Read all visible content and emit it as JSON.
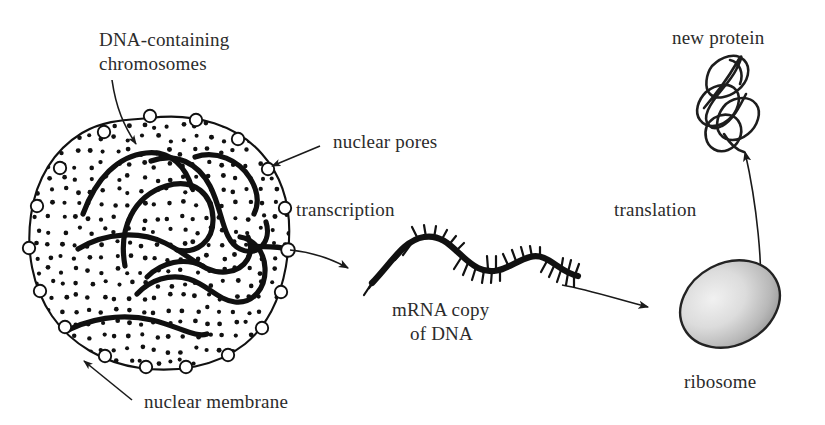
{
  "diagram": {
    "background_color": "#ffffff",
    "ink_color": "#111111",
    "ribosome_fill_light": "#ededed",
    "ribosome_fill_dark": "#9a9a9a"
  },
  "labels": {
    "chromosomes_line1": "DNA-containing",
    "chromosomes_line2": "chromosomes",
    "nuclear_pores": "nuclear pores",
    "nuclear_membrane": "nuclear membrane",
    "transcription": "transcription",
    "translation": "translation",
    "mrna_line1": "mRNA copy",
    "mrna_line2": "of DNA",
    "ribosome": "ribosome",
    "new_protein": "new protein"
  },
  "structures": {
    "nucleus": {
      "name": "nucleus",
      "stipple_dots": 430,
      "pore_count": 18,
      "chromosome_count": 9
    },
    "mrna": {
      "name": "mRNA strand",
      "base_ticks": 34
    },
    "ribosome": {
      "name": "ribosome",
      "shape": "ellipse",
      "rotation_deg": -28
    },
    "protein": {
      "name": "folded protein",
      "shape": "tangled-loops"
    }
  },
  "arrows": {
    "transcription": {
      "from": "nuclear pore",
      "to": "mRNA strand",
      "style": "curved"
    },
    "to_ribosome": {
      "from": "mRNA strand",
      "to": "ribosome",
      "style": "curved"
    },
    "translation": {
      "from": "ribosome",
      "to": "new protein",
      "style": "curved-up"
    },
    "pores_leader": {
      "from": "nuclear pores label",
      "to": "membrane pore",
      "style": "straight"
    },
    "membrane_leader": {
      "from": "nuclear membrane label",
      "to": "membrane",
      "style": "straight"
    },
    "chromosomes_leader": {
      "from": "chromosomes label",
      "to": "chromosome strand",
      "style": "straight"
    }
  }
}
